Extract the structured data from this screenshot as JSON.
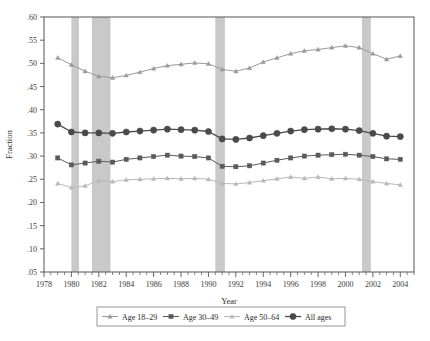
{
  "chart_data": {
    "type": "line",
    "title": "",
    "xlabel": "Year",
    "ylabel": "Fraction",
    "xlim": [
      1978,
      2005
    ],
    "ylim": [
      0.05,
      0.6
    ],
    "grid": false,
    "legend_position": "bottom",
    "y_ticks": [
      0.6,
      0.55,
      0.5,
      0.45,
      0.4,
      0.35,
      0.3,
      0.25,
      0.2,
      0.15,
      0.1,
      0.05
    ],
    "y_tick_labels": [
      ".60",
      ".55",
      ".50",
      ".45",
      ".40",
      ".35",
      ".30",
      ".25",
      ".20",
      ".15",
      ".10",
      ".05"
    ],
    "x_ticks": [
      1978,
      1980,
      1982,
      1984,
      1986,
      1988,
      1990,
      1992,
      1994,
      1996,
      1998,
      2000,
      2002,
      2004
    ],
    "x_tick_labels": [
      "1978",
      "1980",
      "1982",
      "1984",
      "1986",
      "1988",
      "1990",
      "1992",
      "1994",
      "1996",
      "1998",
      "2000",
      "2002",
      "2004"
    ],
    "x_minor_tick_step": 0.5,
    "x": [
      1979,
      1980,
      1981,
      1982,
      1983,
      1984,
      1985,
      1986,
      1987,
      1988,
      1989,
      1990,
      1991,
      1992,
      1993,
      1994,
      1995,
      1996,
      1997,
      1998,
      1999,
      2000,
      2001,
      2002,
      2003,
      2004
    ],
    "series": [
      {
        "name": "Age 18-29",
        "marker": "triangle",
        "color": "#9a9a9a",
        "values": [
          0.512,
          0.497,
          0.483,
          0.472,
          0.469,
          0.474,
          0.481,
          0.489,
          0.495,
          0.498,
          0.501,
          0.499,
          0.487,
          0.483,
          0.49,
          0.503,
          0.512,
          0.521,
          0.527,
          0.53,
          0.534,
          0.538,
          0.534,
          0.521,
          0.509,
          0.516
        ]
      },
      {
        "name": "Age 30-49",
        "marker": "square",
        "color": "#5a5a5a",
        "values": [
          0.296,
          0.281,
          0.285,
          0.289,
          0.287,
          0.293,
          0.296,
          0.299,
          0.302,
          0.3,
          0.299,
          0.296,
          0.278,
          0.277,
          0.279,
          0.285,
          0.291,
          0.296,
          0.3,
          0.302,
          0.303,
          0.304,
          0.302,
          0.299,
          0.294,
          0.293
        ]
      },
      {
        "name": "Age 50-64",
        "marker": "triangle",
        "color": "#b8b8b8",
        "values": [
          0.241,
          0.232,
          0.236,
          0.247,
          0.245,
          0.249,
          0.25,
          0.251,
          0.252,
          0.251,
          0.252,
          0.25,
          0.241,
          0.24,
          0.243,
          0.247,
          0.251,
          0.255,
          0.252,
          0.255,
          0.251,
          0.252,
          0.25,
          0.245,
          0.241,
          0.238
        ]
      },
      {
        "name": "All ages",
        "marker": "circle",
        "color": "#4a4a4a",
        "values": [
          0.369,
          0.352,
          0.35,
          0.35,
          0.349,
          0.352,
          0.354,
          0.356,
          0.358,
          0.357,
          0.356,
          0.353,
          0.337,
          0.336,
          0.339,
          0.344,
          0.349,
          0.354,
          0.357,
          0.358,
          0.359,
          0.358,
          0.355,
          0.349,
          0.343,
          0.342
        ]
      }
    ],
    "recession_bands": [
      {
        "start": 1980.0,
        "end": 1980.55
      },
      {
        "start": 1981.5,
        "end": 1982.85
      },
      {
        "start": 1990.5,
        "end": 1991.2
      },
      {
        "start": 2001.2,
        "end": 2001.85
      }
    ],
    "recession_band_color": "#c9c9c9"
  },
  "legend": {
    "entries": [
      {
        "label": "Age 18–29"
      },
      {
        "label": "Age 30–49"
      },
      {
        "label": "Age 50–64"
      },
      {
        "label": "All ages"
      }
    ]
  }
}
